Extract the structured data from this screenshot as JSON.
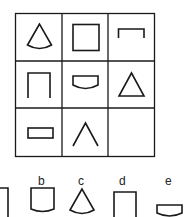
{
  "puzzle": {
    "grid": {
      "rows": 3,
      "cols": 3,
      "cells": [
        [
          "sector",
          "square",
          "bracket-open-bottom"
        ],
        [
          "bracket-open-bottom-tall",
          "flat-top-curved-bottom",
          "triangle"
        ],
        [
          "rectangle",
          "chevron",
          ""
        ]
      ]
    },
    "options": [
      {
        "label": "a",
        "shape": "partial-bracket"
      },
      {
        "label": "b",
        "shape": "cup-curved-bottom"
      },
      {
        "label": "c",
        "shape": "sector"
      },
      {
        "label": "d",
        "shape": "bracket-open-bottom-tall"
      },
      {
        "label": "e",
        "shape": "flat-top-curved-bottom"
      }
    ],
    "line_color": "#1a1a1a"
  }
}
